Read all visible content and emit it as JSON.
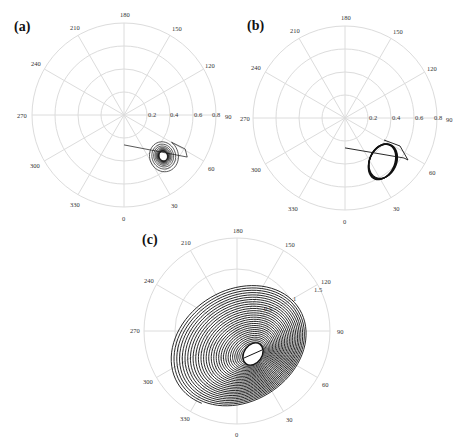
{
  "chart_data": [
    {
      "type": "polar",
      "panel": "(a)",
      "title": "",
      "angular_ticks": [
        "0",
        "30",
        "60",
        "90",
        "120",
        "150",
        "180",
        "210",
        "240",
        "270",
        "300",
        "330"
      ],
      "angular_direction": "counterclockwise, 0 at bottom, 90 at right",
      "radial_ticks": [
        0.2,
        0.4,
        0.6,
        0.8
      ],
      "radial_tick_labels": [
        "0.2",
        "0.4",
        "0.6",
        "0.8"
      ],
      "rlim": [
        0,
        0.8
      ],
      "grid": true,
      "trajectory": {
        "description": "transient line from near origin direction into a spiral that converges to a small limit cycle",
        "start": {
          "theta_deg": 0,
          "r": 0.26
        },
        "attractor_center": {
          "theta_deg": 43,
          "r": 0.5
        },
        "attractor_radius_r": 0.04,
        "outer_loop_radius_r": 0.14,
        "behavior": "damped oscillation converging to stable focus / small limit cycle"
      }
    },
    {
      "type": "polar",
      "panel": "(b)",
      "title": "",
      "angular_ticks": [
        "0",
        "30",
        "60",
        "90",
        "120",
        "150",
        "180",
        "210",
        "240",
        "270",
        "300",
        "330"
      ],
      "radial_ticks": [
        0.2,
        0.4,
        0.6,
        0.8
      ],
      "radial_tick_labels": [
        "0.2",
        "0.4",
        "0.6",
        "0.8"
      ],
      "rlim": [
        0,
        0.8
      ],
      "grid": true,
      "trajectory": {
        "description": "transient line into a thick tilted elliptical limit cycle",
        "start": {
          "theta_deg": 0,
          "r": 0.26
        },
        "attractor_center": {
          "theta_deg": 42,
          "r": 0.5
        },
        "ellipse_semi_axes_r": [
          0.12,
          0.17
        ],
        "behavior": "stable limit cycle"
      }
    },
    {
      "type": "polar",
      "panel": "(c)",
      "title": "",
      "angular_ticks": [
        "0",
        "30",
        "60",
        "90",
        "120",
        "150",
        "180",
        "210",
        "240",
        "270",
        "300",
        "330"
      ],
      "radial_ticks": [
        0.5,
        1,
        1.5
      ],
      "radial_tick_labels": [
        "0.5",
        "1",
        "1.5"
      ],
      "rlim": [
        0,
        1.5
      ],
      "grid": true,
      "trajectory": {
        "description": "large elliptical spiral winding inward to a central elliptical hole containing a short line",
        "start": {
          "theta_deg": 310,
          "r": 1.15
        },
        "attractor_center": {
          "theta_deg": 30,
          "r": 0.35
        },
        "turns": 30,
        "behavior": "inward spiral converging to a limit cycle"
      }
    }
  ],
  "panels": {
    "a": {
      "label": "(a)"
    },
    "b": {
      "label": "(b)"
    },
    "c": {
      "label": "(c)"
    }
  },
  "angular_labels": {
    "deg0": "0",
    "deg30": "30",
    "deg60": "60",
    "deg90": "90",
    "deg120": "120",
    "deg150": "150",
    "deg180": "180",
    "deg210": "210",
    "deg240": "240",
    "deg270": "270",
    "deg300": "300",
    "deg330": "330"
  },
  "radial_labels_ab": {
    "r1": "0.2",
    "r2": "0.4",
    "r3": "0.6",
    "r4": "0.8"
  },
  "radial_labels_c": {
    "r1": "0.5",
    "r2": "1",
    "r3": "1.5"
  }
}
